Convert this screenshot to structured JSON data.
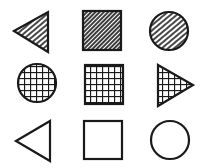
{
  "figure": {
    "ink_color": "#1a1a1a",
    "background": "#ffffff",
    "rows": [
      {
        "row": 1,
        "cells": [
          {
            "shape": "triangle-left",
            "fill": "diagonal-hatch"
          },
          {
            "shape": "square",
            "fill": "dense-diagonal-hatch"
          },
          {
            "shape": "circle",
            "fill": "diagonal-hatch"
          }
        ]
      },
      {
        "row": 2,
        "cells": [
          {
            "shape": "circle",
            "fill": "grid-crosshatch"
          },
          {
            "shape": "square",
            "fill": "grid-crosshatch"
          },
          {
            "shape": "triangle-right",
            "fill": "grid-crosshatch"
          }
        ]
      },
      {
        "row": 3,
        "cells": [
          {
            "shape": "triangle-left",
            "fill": "none"
          },
          {
            "shape": "square",
            "fill": "none"
          },
          {
            "shape": "circle",
            "fill": "none"
          }
        ]
      }
    ]
  }
}
